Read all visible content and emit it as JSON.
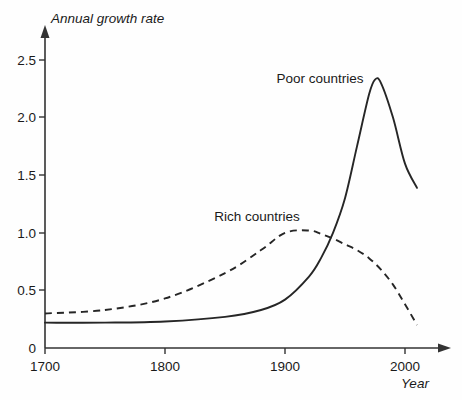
{
  "chart_data": {
    "type": "line",
    "title": "",
    "xlabel": "Year",
    "ylabel": "Annual growth rate",
    "xlim": [
      1700,
      2020
    ],
    "ylim": [
      0,
      2.75
    ],
    "grid": false,
    "legend_position": "inline-annotation",
    "x_ticks": [
      "1700",
      "1800",
      "1900",
      "2000"
    ],
    "x_tick_values": [
      1700,
      1800,
      1900,
      2000
    ],
    "y_ticks": [
      "0",
      "0.5",
      "1.0",
      "1.5",
      "2.0",
      "2.5"
    ],
    "y_tick_values": [
      0,
      0.5,
      1.0,
      1.5,
      2.0,
      2.5
    ],
    "series": [
      {
        "name": "Poor countries",
        "style": "solid",
        "color": "#262626",
        "x": [
          1700,
          1750,
          1800,
          1850,
          1880,
          1900,
          1920,
          1930,
          1940,
          1950,
          1960,
          1970,
          1975,
          1980,
          1990,
          2000,
          2010
        ],
        "values": [
          0.22,
          0.22,
          0.23,
          0.27,
          0.33,
          0.42,
          0.62,
          0.78,
          1.0,
          1.3,
          1.75,
          2.2,
          2.33,
          2.3,
          2.0,
          1.6,
          1.39
        ]
      },
      {
        "name": "Rich countries",
        "style": "dashed",
        "color": "#262626",
        "x": [
          1700,
          1750,
          1800,
          1850,
          1880,
          1900,
          1920,
          1930,
          1940,
          1950,
          1960,
          1970,
          1980,
          1990,
          2000,
          2010
        ],
        "values": [
          0.3,
          0.33,
          0.43,
          0.65,
          0.85,
          1.0,
          1.02,
          0.99,
          0.95,
          0.9,
          0.85,
          0.78,
          0.68,
          0.55,
          0.38,
          0.2
        ]
      }
    ],
    "annotations": [
      {
        "text": "Poor countries",
        "x": 1955,
        "y": 2.6
      },
      {
        "text": "Rich countries",
        "x": 1890,
        "y": 1.25
      }
    ]
  },
  "labels": {
    "y_axis_title": "Annual growth rate",
    "x_axis_title": "Year",
    "series_poor": "Poor countries",
    "series_rich": "Rich countries",
    "y_tick_0": "0",
    "y_tick_05": "0.5",
    "y_tick_10": "1.0",
    "y_tick_15": "1.5",
    "y_tick_20": "2.0",
    "y_tick_25": "2.5",
    "x_tick_1700": "1700",
    "x_tick_1800": "1800",
    "x_tick_1900": "1900",
    "x_tick_2000": "2000"
  },
  "colors": {
    "ink": "#262626",
    "axis": "#333333",
    "background": "#fefefe"
  }
}
